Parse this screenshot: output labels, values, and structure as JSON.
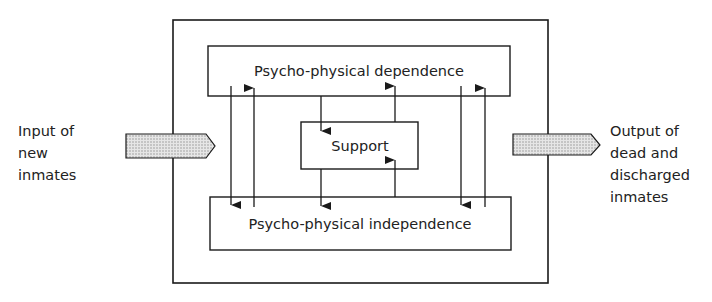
{
  "diagram": {
    "boxes": {
      "dependence": "Psycho-physical dependence",
      "support": "Support",
      "independence": "Psycho-physical independence"
    },
    "input_label": [
      "Input of",
      "new",
      "inmates"
    ],
    "output_label": [
      "Output of",
      "dead and",
      "discharged",
      "inmates"
    ],
    "arrows": [
      {
        "from": "Psycho-physical dependence",
        "to": "Psycho-physical independence"
      },
      {
        "from": "Psycho-physical independence",
        "to": "Psycho-physical dependence"
      },
      {
        "from": "Psycho-physical dependence",
        "to": "Support"
      },
      {
        "from": "Support",
        "to": "Psycho-physical dependence"
      },
      {
        "from": "Support",
        "to": "Psycho-physical independence"
      },
      {
        "from": "Psycho-physical independence",
        "to": "Support"
      },
      {
        "from": "Psycho-physical dependence",
        "to": "Psycho-physical independence"
      },
      {
        "from": "Psycho-physical independence",
        "to": "Psycho-physical dependence"
      }
    ],
    "colors": {
      "line": "#1a1a1a",
      "arrow_fill": "#d8d8d8"
    }
  }
}
